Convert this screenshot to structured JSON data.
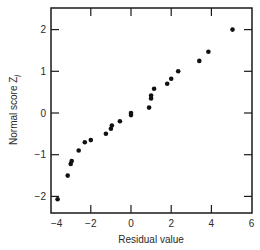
{
  "chart_data": {
    "type": "scatter",
    "title": "",
    "xlabel": "Residual value",
    "ylabel": "Normal score Z",
    "ylabel_subscript": "j",
    "xlim": [
      -4,
      6
    ],
    "ylim": [
      -2.35,
      2.6
    ],
    "x_ticks": [
      -4,
      -2,
      0,
      2,
      4,
      6
    ],
    "x_tick_labels": [
      "−4",
      "−2",
      "0",
      "2",
      "4",
      "6"
    ],
    "y_ticks": [
      -2,
      -1,
      0,
      1,
      2
    ],
    "y_tick_labels": [
      "−2",
      "−1",
      "0",
      "1",
      "2"
    ],
    "grid": false,
    "legend": null,
    "marker_color": "#111111",
    "series": [
      {
        "name": "Residuals vs normal scores",
        "points": [
          [
            -3.65,
            -2.07
          ],
          [
            -3.15,
            -1.5
          ],
          [
            -3.0,
            -1.22
          ],
          [
            -2.95,
            -1.15
          ],
          [
            -2.6,
            -0.9
          ],
          [
            -2.3,
            -0.7
          ],
          [
            -2.0,
            -0.65
          ],
          [
            -1.25,
            -0.5
          ],
          [
            -1.0,
            -0.38
          ],
          [
            -0.95,
            -0.3
          ],
          [
            -0.55,
            -0.2
          ],
          [
            0.0,
            -0.05
          ],
          [
            0.0,
            0.0
          ],
          [
            0.9,
            0.13
          ],
          [
            1.0,
            0.35
          ],
          [
            1.0,
            0.42
          ],
          [
            1.15,
            0.58
          ],
          [
            1.8,
            0.7
          ],
          [
            2.0,
            0.82
          ],
          [
            2.35,
            1.0
          ],
          [
            3.4,
            1.25
          ],
          [
            3.85,
            1.47
          ],
          [
            5.05,
            2.0
          ]
        ]
      }
    ]
  }
}
